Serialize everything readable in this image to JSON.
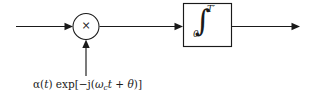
{
  "diagram": {
    "background_color": "#ffffff",
    "line_color": "#1a1a1a",
    "multiplier": {
      "symbol": "×",
      "name": "multiplier-node"
    },
    "integrator": {
      "integral_symbol": "∫",
      "upper_limit": "T",
      "upper_limit_prime": "′",
      "lower_limit": "0",
      "name": "integrator-block"
    },
    "local_oscillator": {
      "alpha": "α(",
      "alpha_var": "t",
      "alpha_close": ") exp[−j(",
      "omega": "ω",
      "omega_sub": "c",
      "time_var": "t",
      "plus": " + ",
      "theta": "θ",
      "close": ")]",
      "full_text": "α(t) exp[−j(ωc t + θ)]"
    },
    "signals": {
      "input_label": "",
      "output_label": "",
      "intermediate_label": ""
    }
  }
}
